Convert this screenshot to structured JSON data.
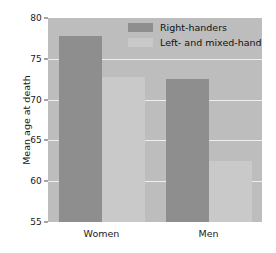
{
  "chart_data": {
    "type": "bar",
    "title": "",
    "xlabel": "",
    "ylabel": "Mean age at death",
    "categories": [
      "Women",
      "Men"
    ],
    "series": [
      {
        "name": "Right-handers",
        "values": [
          77.8,
          72.5
        ],
        "color": "#8e8e8e"
      },
      {
        "name": "Left- and mixed-handers",
        "values": [
          72.8,
          62.5
        ],
        "color": "#c9c9c9"
      }
    ],
    "ylim": [
      55,
      80
    ],
    "yticks": [
      55,
      60,
      65,
      70,
      75,
      80
    ],
    "grid": true,
    "legend_position": "top-right",
    "plot_background": "#bdbdbd",
    "gridline_color": "#eeeeee"
  },
  "axis": {
    "y_label": "Mean age at death",
    "y_ticks": [
      "55",
      "60",
      "65",
      "70",
      "75",
      "80"
    ],
    "x_ticks": [
      "Women",
      "Men"
    ]
  },
  "legend": {
    "items": [
      {
        "label": "Right-handers",
        "color": "#8e8e8e"
      },
      {
        "label": "Left- and mixed-handers",
        "color": "#c9c9c9"
      }
    ]
  }
}
